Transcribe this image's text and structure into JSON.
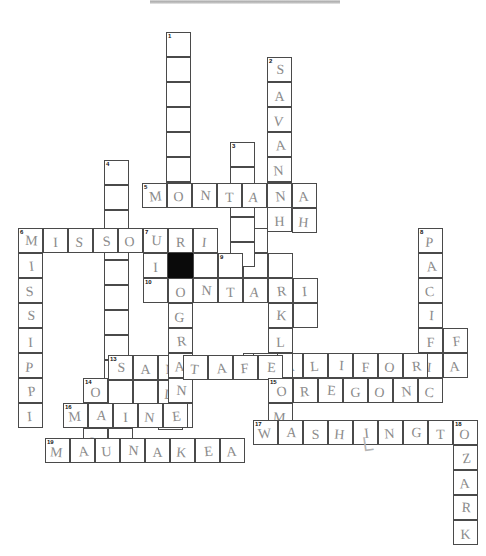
{
  "document": {
    "type": "crossword-puzzle-worksheet",
    "title": "Crossword Puzzle (handwritten answers)",
    "cell_size": 25,
    "pencil_color": "#8b8b8b",
    "ink_color": "#4a4a4a",
    "block_color": "#0a0a0a"
  },
  "entries": [
    {
      "number": "1",
      "direction": "down",
      "col": 6,
      "row": 0,
      "length": 7,
      "answer": ""
    },
    {
      "number": "2",
      "direction": "down",
      "col": 10,
      "row": 1,
      "length": 8,
      "answer": "SAVANNAH"
    },
    {
      "number": "3",
      "direction": "down",
      "col": 9,
      "row": 5,
      "length": 5,
      "answer": ""
    },
    {
      "number": "4",
      "direction": "down",
      "col": 4,
      "row": 5,
      "length": 9,
      "answer": ""
    },
    {
      "number": "5",
      "direction": "across",
      "col": 5,
      "row": 7,
      "length": 7,
      "answer": "MONTANAH"
    },
    {
      "number": "6",
      "direction": "across",
      "col": 0,
      "row": 9,
      "length": 8,
      "answer": "MISSOURI"
    },
    {
      "number": "6",
      "direction": "down",
      "col": 0,
      "row": 9,
      "length": 11,
      "answer": "MISSISSIPPI"
    },
    {
      "number": "7",
      "direction": "down",
      "col": 6,
      "row": 9,
      "length": 9,
      "answer": "RIOGRANDE"
    },
    {
      "number": "8",
      "direction": "down",
      "col": 16,
      "row": 9,
      "length": 7,
      "answer": "PACIFIC"
    },
    {
      "number": "9",
      "direction": "block",
      "col": 7,
      "row": 10,
      "length": 1,
      "answer": ""
    },
    {
      "number": "10",
      "direction": "across",
      "col": 6,
      "row": 11,
      "length": 7,
      "answer": "ONTARIO"
    },
    {
      "number": "11",
      "direction": "down",
      "col": 11,
      "row": 11,
      "length": 8,
      "answer": "OKLAHOMA"
    },
    {
      "number": "12",
      "direction": "across",
      "col": 10,
      "row": 14,
      "length": 10,
      "answer": "CALIFORNIA"
    },
    {
      "number": "13",
      "direction": "across",
      "col": 4,
      "row": 15,
      "length": 7,
      "answer": "SANTAFE"
    },
    {
      "number": "14",
      "direction": "down",
      "col": 3,
      "row": 16,
      "length": 4,
      "answer": "OAHU"
    },
    {
      "number": "15",
      "direction": "across",
      "col": 11,
      "row": 16,
      "length": 6,
      "answer": "OREGON"
    },
    {
      "number": "16",
      "direction": "across",
      "col": 2,
      "row": 17,
      "length": 5,
      "answer": "MAINE"
    },
    {
      "number": "17",
      "direction": "across",
      "col": 10,
      "row": 18,
      "length": 10,
      "answer": "WASHINGTON"
    },
    {
      "number": "18",
      "direction": "down",
      "col": 17,
      "row": 18,
      "length": 5,
      "answer": "OZARK"
    },
    {
      "number": "19",
      "direction": "across",
      "col": 1,
      "row": 20,
      "length": 8,
      "answer": "MAUNAKEA"
    }
  ],
  "cells": [
    {
      "x": 166,
      "y": 32,
      "n": "1",
      "l": ""
    },
    {
      "x": 166,
      "y": 57,
      "l": ""
    },
    {
      "x": 166,
      "y": 82,
      "l": ""
    },
    {
      "x": 166,
      "y": 107,
      "l": ""
    },
    {
      "x": 166,
      "y": 132,
      "l": ""
    },
    {
      "x": 166,
      "y": 157,
      "l": ""
    },
    {
      "x": 267,
      "y": 57,
      "n": "2",
      "l": "S"
    },
    {
      "x": 267,
      "y": 82,
      "l": "A"
    },
    {
      "x": 267,
      "y": 107,
      "l": "V"
    },
    {
      "x": 267,
      "y": 132,
      "l": "A"
    },
    {
      "x": 267,
      "y": 157,
      "l": "N"
    },
    {
      "x": 267,
      "y": 182,
      "l": "N"
    },
    {
      "x": 267,
      "y": 207,
      "l": "H"
    },
    {
      "x": 230,
      "y": 142,
      "n": "3",
      "l": ""
    },
    {
      "x": 230,
      "y": 167,
      "l": ""
    },
    {
      "x": 230,
      "y": 217,
      "l": ""
    },
    {
      "x": 230,
      "y": 242,
      "l": ""
    },
    {
      "x": 104,
      "y": 160,
      "n": "4",
      "l": ""
    },
    {
      "x": 104,
      "y": 185,
      "l": ""
    },
    {
      "x": 104,
      "y": 210,
      "l": ""
    },
    {
      "x": 104,
      "y": 260,
      "l": ""
    },
    {
      "x": 104,
      "y": 285,
      "l": ""
    },
    {
      "x": 104,
      "y": 310,
      "l": ""
    },
    {
      "x": 104,
      "y": 335,
      "l": ""
    },
    {
      "x": 142,
      "y": 183,
      "n": "5",
      "l": "M"
    },
    {
      "x": 167,
      "y": 183,
      "l": "O"
    },
    {
      "x": 192,
      "y": 183,
      "l": "N"
    },
    {
      "x": 217,
      "y": 183,
      "l": "T"
    },
    {
      "x": 242,
      "y": 183,
      "l": "A"
    },
    {
      "x": 267,
      "y": 183,
      "l": "N"
    },
    {
      "x": 292,
      "y": 183,
      "l": "A"
    },
    {
      "x": 18,
      "y": 228,
      "n": "6",
      "l": "M"
    },
    {
      "x": 43,
      "y": 228,
      "l": "I"
    },
    {
      "x": 68,
      "y": 228,
      "l": "S"
    },
    {
      "x": 93,
      "y": 228,
      "l": "S"
    },
    {
      "x": 118,
      "y": 228,
      "l": "O"
    },
    {
      "x": 143,
      "y": 228,
      "n": "7",
      "l": "U"
    },
    {
      "x": 168,
      "y": 228,
      "l": "R"
    },
    {
      "x": 193,
      "y": 228,
      "l": "I"
    },
    {
      "x": 18,
      "y": 253,
      "l": "I"
    },
    {
      "x": 18,
      "y": 278,
      "l": "S"
    },
    {
      "x": 18,
      "y": 303,
      "l": "S"
    },
    {
      "x": 18,
      "y": 328,
      "l": "I"
    },
    {
      "x": 18,
      "y": 353,
      "l": "P"
    },
    {
      "x": 18,
      "y": 378,
      "l": "P"
    },
    {
      "x": 18,
      "y": 403,
      "l": "I"
    },
    {
      "x": 168,
      "y": 253,
      "l": "I"
    },
    {
      "x": 168,
      "y": 278,
      "l": "O"
    },
    {
      "x": 168,
      "y": 303,
      "l": "G"
    },
    {
      "x": 168,
      "y": 328,
      "l": "R"
    },
    {
      "x": 168,
      "y": 353,
      "l": "A"
    },
    {
      "x": 168,
      "y": 378,
      "l": "N"
    },
    {
      "x": 168,
      "y": 403,
      "l": "D"
    },
    {
      "x": 418,
      "y": 228,
      "n": "8",
      "l": "P"
    },
    {
      "x": 418,
      "y": 253,
      "l": "A"
    },
    {
      "x": 418,
      "y": 278,
      "l": "C"
    },
    {
      "x": 418,
      "y": 303,
      "l": "I"
    },
    {
      "x": 418,
      "y": 328,
      "l": "F"
    },
    {
      "x": 418,
      "y": 378,
      "l": "C"
    },
    {
      "x": 218,
      "y": 253,
      "n": "9",
      "l": ""
    },
    {
      "x": 143,
      "y": 278,
      "n": "10",
      "l": ""
    },
    {
      "x": 193,
      "y": 278,
      "l": "N"
    },
    {
      "x": 218,
      "y": 278,
      "l": "T"
    },
    {
      "x": 243,
      "y": 278,
      "l": "A"
    },
    {
      "x": 268,
      "y": 278,
      "l": "R"
    },
    {
      "x": 293,
      "y": 278,
      "l": "I"
    },
    {
      "x": 268,
      "y": 303,
      "l": "K"
    },
    {
      "x": 268,
      "y": 328,
      "l": "L"
    },
    {
      "x": 268,
      "y": 378,
      "l": "H"
    },
    {
      "x": 253,
      "y": 353,
      "n": "12",
      "l": "C"
    },
    {
      "x": 303,
      "y": 353,
      "l": "L"
    },
    {
      "x": 328,
      "y": 353,
      "l": "I"
    },
    {
      "x": 353,
      "y": 353,
      "l": "F"
    },
    {
      "x": 378,
      "y": 353,
      "l": "O"
    },
    {
      "x": 403,
      "y": 353,
      "l": "R"
    },
    {
      "x": 443,
      "y": 353,
      "l": "A"
    },
    {
      "x": 108,
      "y": 355,
      "n": "13",
      "l": "S"
    },
    {
      "x": 133,
      "y": 355,
      "l": "A"
    },
    {
      "x": 183,
      "y": 355,
      "l": "T"
    },
    {
      "x": 208,
      "y": 355,
      "l": "A"
    },
    {
      "x": 233,
      "y": 355,
      "l": "F"
    },
    {
      "x": 258,
      "y": 355,
      "l": "E"
    },
    {
      "x": 83,
      "y": 378,
      "n": "14",
      "l": "O"
    },
    {
      "x": 83,
      "y": 428,
      "l": "H"
    },
    {
      "x": 268,
      "y": 378,
      "n": "15",
      "l": "O"
    },
    {
      "x": 293,
      "y": 378,
      "l": "R"
    },
    {
      "x": 318,
      "y": 378,
      "l": "E"
    },
    {
      "x": 343,
      "y": 378,
      "l": "G"
    },
    {
      "x": 368,
      "y": 378,
      "l": "O"
    },
    {
      "x": 393,
      "y": 378,
      "l": "N"
    },
    {
      "x": 63,
      "y": 403,
      "n": "16",
      "l": "M"
    },
    {
      "x": 88,
      "y": 403,
      "l": "A"
    },
    {
      "x": 113,
      "y": 403,
      "l": "I"
    },
    {
      "x": 138,
      "y": 403,
      "l": "N"
    },
    {
      "x": 163,
      "y": 403,
      "l": "E"
    },
    {
      "x": 253,
      "y": 420,
      "n": "17",
      "l": "W"
    },
    {
      "x": 278,
      "y": 420,
      "l": "A"
    },
    {
      "x": 303,
      "y": 420,
      "l": "S"
    },
    {
      "x": 328,
      "y": 420,
      "l": "H"
    },
    {
      "x": 353,
      "y": 420,
      "l": "I"
    },
    {
      "x": 378,
      "y": 420,
      "l": "N"
    },
    {
      "x": 403,
      "y": 420,
      "l": "G"
    },
    {
      "x": 428,
      "y": 420,
      "l": "T"
    },
    {
      "x": 453,
      "y": 420,
      "n": "18",
      "l": "O"
    },
    {
      "x": 453,
      "y": 445,
      "l": "Z"
    },
    {
      "x": 453,
      "y": 470,
      "l": "A"
    },
    {
      "x": 453,
      "y": 495,
      "l": "R"
    },
    {
      "x": 453,
      "y": 520,
      "l": "K"
    },
    {
      "x": 45,
      "y": 438,
      "n": "19",
      "l": "M"
    },
    {
      "x": 70,
      "y": 438,
      "l": "A"
    },
    {
      "x": 95,
      "y": 438,
      "l": "U"
    },
    {
      "x": 120,
      "y": 438,
      "l": "N"
    },
    {
      "x": 145,
      "y": 438,
      "l": "A"
    },
    {
      "x": 170,
      "y": 438,
      "l": "K"
    },
    {
      "x": 195,
      "y": 438,
      "l": "E"
    },
    {
      "x": 220,
      "y": 438,
      "l": "A"
    }
  ],
  "extra_cells": [
    {
      "x": 166,
      "y": 182,
      "l": ""
    },
    {
      "x": 292,
      "y": 208,
      "l": "H"
    },
    {
      "x": 230,
      "y": 192,
      "l": ""
    },
    {
      "x": 104,
      "y": 235,
      "l": ""
    },
    {
      "x": 104,
      "y": 360,
      "l": ""
    },
    {
      "x": 143,
      "y": 253,
      "l": "I"
    },
    {
      "x": 193,
      "y": 253,
      "l": ""
    },
    {
      "x": 243,
      "y": 253,
      "l": ""
    },
    {
      "x": 243,
      "y": 228,
      "l": ""
    },
    {
      "x": 268,
      "y": 253,
      "l": ""
    },
    {
      "x": 293,
      "y": 303,
      "l": ""
    },
    {
      "x": 418,
      "y": 353,
      "l": "I"
    },
    {
      "x": 443,
      "y": 328,
      "l": "F"
    },
    {
      "x": 278,
      "y": 353,
      "l": "A"
    },
    {
      "x": 268,
      "y": 353,
      "l": ""
    },
    {
      "x": 158,
      "y": 355,
      "l": "N"
    },
    {
      "x": 158,
      "y": 380,
      "l": "D"
    },
    {
      "x": 158,
      "y": 405,
      "l": "E"
    },
    {
      "x": 108,
      "y": 380,
      "l": ""
    },
    {
      "x": 133,
      "y": 380,
      "l": ""
    },
    {
      "x": 108,
      "y": 428,
      "l": ""
    },
    {
      "x": 268,
      "y": 403,
      "l": "M"
    },
    {
      "x": 243,
      "y": 353,
      "l": "E"
    }
  ],
  "block_cell": {
    "x": 168,
    "y": 253
  },
  "stray_marks": [
    {
      "name": "pencil-check-mark",
      "x": 358,
      "y": 437,
      "glyph": "└",
      "size": 22,
      "rotate": "-8deg"
    }
  ]
}
